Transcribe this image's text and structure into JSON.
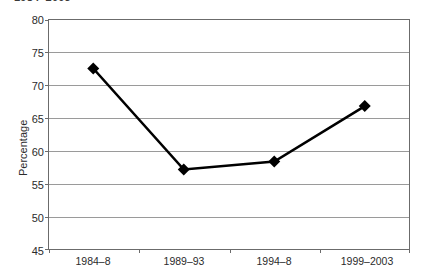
{
  "title": {
    "text_fragment": "1984–2003",
    "clipped": "top"
  },
  "axes": {
    "y_title": "Percentage",
    "y_ticks": [
      "80",
      "75",
      "70",
      "65",
      "60",
      "55",
      "50",
      "45"
    ],
    "x_ticks": [
      "1984–8",
      "1989–93",
      "1994–8",
      "1999–2003"
    ]
  },
  "style": {
    "line_color": "#000000",
    "marker_color": "#000000",
    "gridline_color": "#9a9a9a",
    "frame_color": "#6b6b6b",
    "background": "#ffffff",
    "text_color": "#2b2b2b"
  },
  "chart_data": {
    "type": "line",
    "title": "1984–2003",
    "xlabel": "",
    "ylabel": "Percentage",
    "categories": [
      "1984–8",
      "1989–93",
      "1994–8",
      "1999–2003"
    ],
    "series": [
      {
        "name": "Percentage",
        "values": [
          72.5,
          57.2,
          58.4,
          66.8
        ]
      }
    ],
    "ylim": [
      45,
      80
    ],
    "ytick_step": 5,
    "grid": "horizontal",
    "legend": "none",
    "marker": "diamond"
  }
}
